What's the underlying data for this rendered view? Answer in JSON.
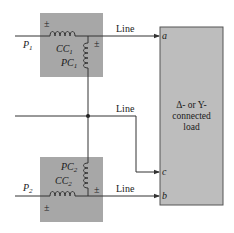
{
  "diagram": {
    "type": "two-wattmeter three-phase measurement circuit",
    "colors": {
      "wattmeter_box": "#a7a7a7",
      "load_box": "#bdbdbd",
      "wire": "#333333",
      "text": "#1a1a1a"
    },
    "wattmeters": [
      {
        "id": "W1",
        "power_label": "P",
        "power_sub": "1",
        "current_coil": "CC",
        "current_coil_sub": "1",
        "potential_coil": "PC",
        "potential_coil_sub": "1",
        "polarity_mark": "±"
      },
      {
        "id": "W2",
        "power_label": "P",
        "power_sub": "2",
        "current_coil": "CC",
        "current_coil_sub": "2",
        "potential_coil": "PC",
        "potential_coil_sub": "2",
        "polarity_mark": "±"
      }
    ],
    "lines": [
      {
        "label": "Line",
        "terminal": "a"
      },
      {
        "label": "Line",
        "terminal": "c"
      },
      {
        "label": "Line",
        "terminal": "b"
      }
    ],
    "load": {
      "line1": "Δ- or Y-",
      "line2": "connected",
      "line3": "load"
    }
  }
}
